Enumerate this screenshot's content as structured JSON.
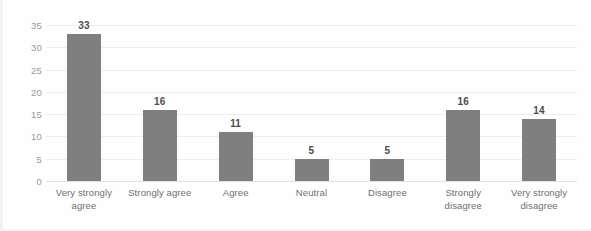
{
  "chart_data": {
    "type": "bar",
    "title": "",
    "subtitle": "",
    "xlabel": "",
    "ylabel": "",
    "categories": [
      "Very strongly agree",
      "Strongly agree",
      "Agree",
      "Neutral",
      "Disagree",
      "Strongly disagree",
      "Very strongly disagree"
    ],
    "values": [
      33,
      16,
      11,
      5,
      5,
      16,
      14
    ],
    "ylim": [
      0,
      35
    ],
    "ytick_step": 5,
    "yticks": [
      35,
      30,
      25,
      20,
      15,
      10,
      5,
      0
    ],
    "ytick_labels": [
      "35",
      "30",
      "25",
      "20",
      "15",
      "10",
      "5",
      "0"
    ],
    "data_labels": [
      "33",
      "16",
      "11",
      "5",
      "5",
      "16",
      "14"
    ],
    "grid": true,
    "grid_axis": "y",
    "legend": false,
    "legend_position": "none",
    "series": [
      {
        "name": "Responses",
        "values": [
          33,
          16,
          11,
          5,
          5,
          16,
          14
        ]
      }
    ]
  },
  "colors": {
    "bar": "#7f7f7f",
    "gridline": "#ededed",
    "baseline": "#e2e2e2",
    "tick_text": "#9b9b9b",
    "category_text": "#6f6f6f",
    "value_text": "#4d4d4d",
    "background": "#fefefe"
  }
}
